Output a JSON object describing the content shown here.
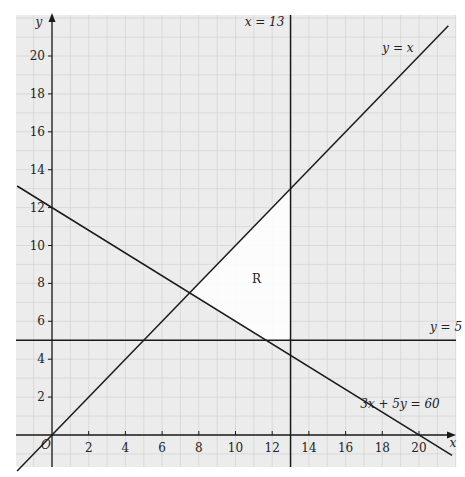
{
  "chart_data": {
    "type": "line",
    "title": "",
    "xlabel": "x",
    "ylabel": "y",
    "xlim": [
      -2,
      22
    ],
    "ylim": [
      -1.7,
      22
    ],
    "grid": true,
    "x_ticks": [
      2,
      4,
      6,
      8,
      10,
      12,
      14,
      16,
      18,
      20
    ],
    "y_ticks": [
      2,
      4,
      6,
      8,
      10,
      12,
      14,
      16,
      18,
      20
    ],
    "origin_label": "O",
    "series": [
      {
        "name": "y = x",
        "kind": "line",
        "points": [
          [
            -1.9,
            -1.9
          ],
          [
            21.6,
            21.6
          ]
        ]
      },
      {
        "name": "x = 13",
        "kind": "vertical",
        "x": 13
      },
      {
        "name": "y = 5",
        "kind": "horizontal",
        "y": 5
      },
      {
        "name": "3x + 5y = 60",
        "kind": "line",
        "points": [
          [
            -1.9,
            13.14
          ],
          [
            21.8,
            -1.08
          ]
        ]
      }
    ],
    "feasible_region": {
      "label": "R",
      "vertices": [
        [
          7.5,
          7.5
        ],
        [
          11.67,
          5
        ],
        [
          13,
          5
        ],
        [
          13,
          13
        ]
      ],
      "fill": "#ffffff"
    },
    "annotations": [
      {
        "text": "x = 13",
        "x": 10.5,
        "y": 21.6
      },
      {
        "text": "y = x",
        "x": 18,
        "y": 20.2
      },
      {
        "text": "y = 5",
        "x": 20.6,
        "y": 5.5
      },
      {
        "text": "3x + 5y = 60",
        "x": 16.8,
        "y": 1.4
      },
      {
        "text": "R",
        "x": 10.9,
        "y": 8
      }
    ]
  },
  "style": {
    "background": "#ffffff",
    "grid_fill": "#ececec",
    "grid_line": "#d2d2d2",
    "line_color": "#1a1a1a",
    "region_fill": "#ffffff"
  },
  "layout": {
    "origin_px": [
      52,
      435
    ],
    "unit_x_px": 18.35,
    "unit_y_px": 18.95,
    "grid_box_px": [
      16,
      15,
      456,
      467
    ]
  }
}
